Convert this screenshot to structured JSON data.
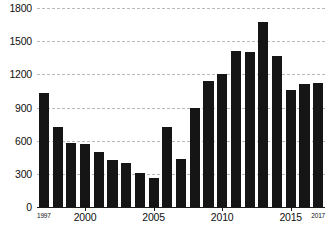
{
  "chart_data": {
    "type": "bar",
    "title": "",
    "subtitle": "",
    "xlabel": "",
    "ylabel": "",
    "categories": [
      "1997",
      "1998",
      "1999",
      "2000",
      "2001",
      "2002",
      "2003",
      "2004",
      "2005",
      "2006",
      "2007",
      "2008",
      "2009",
      "2010",
      "2011",
      "2012",
      "2013",
      "2014",
      "2015",
      "2016",
      "2017"
    ],
    "values": [
      1030,
      720,
      575,
      570,
      495,
      425,
      400,
      310,
      265,
      720,
      435,
      895,
      1140,
      1200,
      1415,
      1405,
      1670,
      1370,
      1055,
      1110,
      1125
    ],
    "series": [
      {
        "name": "count",
        "values": [
          1030,
          720,
          575,
          570,
          495,
          425,
          400,
          310,
          265,
          720,
          435,
          895,
          1140,
          1200,
          1415,
          1405,
          1670,
          1370,
          1055,
          1110,
          1125
        ]
      }
    ],
    "ylim": [
      0,
      1800
    ],
    "yticks": [
      0,
      300,
      600,
      900,
      1200,
      1500,
      1800
    ],
    "ytick_labels": [
      "0",
      "300",
      "600",
      "900",
      "1200",
      "1500",
      "1800"
    ],
    "xticks": [
      "1997",
      "2000",
      "2005",
      "2010",
      "2015",
      "2017"
    ],
    "xtick_labels": [
      "1997",
      "2000",
      "2005",
      "2010",
      "2015",
      "2017"
    ],
    "xtick_small": [
      "1997",
      "2017"
    ],
    "grid": "horizontal-dashed",
    "legend": "none",
    "bar_color": "#151515",
    "grid_color": "#b9b9b9",
    "axis_color": "#1a1a1a",
    "background_color": "#ffffff"
  },
  "caption": {
    "text": ""
  }
}
